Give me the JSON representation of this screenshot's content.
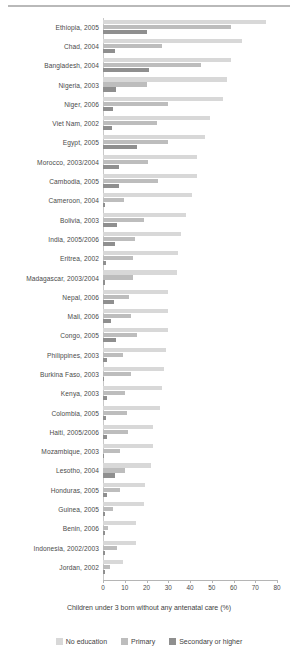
{
  "chart_data": {
    "type": "bar",
    "orientation": "horizontal",
    "title": "",
    "xlabel": "Children under 3 born without any antenatal care (%)",
    "ylabel": "",
    "xlim": [
      0,
      80
    ],
    "xticks": [
      0,
      10,
      20,
      30,
      40,
      50,
      60,
      70,
      80
    ],
    "grid": false,
    "legend_position": "bottom",
    "legend": [
      "No education",
      "Primary",
      "Secondary or higher"
    ],
    "series": [
      {
        "name": "No education",
        "color": "#d8d8d8",
        "values": [
          75,
          64,
          59,
          57,
          55,
          49,
          47,
          43,
          43,
          41,
          38,
          36,
          34.5,
          34,
          30,
          30,
          30,
          29,
          28,
          27,
          26,
          23,
          23,
          22,
          19.5,
          19,
          15,
          15,
          9
        ]
      },
      {
        "name": "Primary",
        "color": "#bdbdbd",
        "values": [
          59,
          27,
          45,
          20,
          30,
          25,
          30,
          20.5,
          25.5,
          9.5,
          19,
          14.5,
          14,
          14,
          12,
          13,
          15.5,
          9,
          13,
          10,
          11,
          11.5,
          8,
          10,
          8,
          4.5,
          2.5,
          6.5,
          3
        ]
      },
      {
        "name": "Secondary or higher",
        "color": "#8f8f8f",
        "values": [
          20,
          5.5,
          21,
          6,
          4.5,
          4,
          15.5,
          7.5,
          7.5,
          1,
          6.5,
          5.5,
          1.5,
          1,
          5,
          3.5,
          6,
          2,
          0.5,
          2,
          1.5,
          2,
          0.5,
          5.5,
          2,
          1,
          1,
          1,
          0.8
        ]
      }
    ],
    "categories": [
      "Ethiopia, 2005",
      "Chad, 2004",
      "Bangladesh, 2004",
      "Nigeria, 2003",
      "Niger, 2006",
      "Viet Nam, 2002",
      "Egypt, 2005",
      "Morocco, 2003/2004",
      "Cambodia, 2005",
      "Cameroon, 2004",
      "Bolivia, 2003",
      "India, 2005/2006",
      "Eritrea, 2002",
      "Madagascar, 2003/2004",
      "Nepal, 2006",
      "Mali, 2006",
      "Congo, 2005",
      "Philippines, 2003",
      "Burkina Faso, 2003",
      "Kenya, 2003",
      "Colombia, 2005",
      "Haiti, 2005/2006",
      "Mozambique, 2003",
      "Lesotho, 2004",
      "Honduras, 2005",
      "Guinea, 2005",
      "Benin, 2006",
      "Indonesia, 2002/2003",
      "Jordan, 2002"
    ]
  },
  "colors": {
    "no_education": "#d8d8d8",
    "primary": "#bdbdbd",
    "secondary_or_higher": "#8f8f8f",
    "axis": "#b5b5b5",
    "text": "#3f3f3f"
  }
}
